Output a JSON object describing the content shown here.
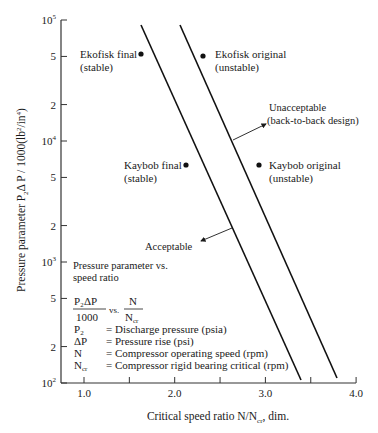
{
  "chart_data": {
    "type": "scatter",
    "title": "",
    "xlabel": "Critical speed ratio N/N_cr, dim.",
    "ylabel": "Pressure parameter P2ΔP / 1000(lb²/in⁴)",
    "xlim": [
      0.75,
      4.0
    ],
    "ylim": [
      100,
      100000
    ],
    "yscale": "log",
    "grid": false,
    "x_ticks": [
      {
        "v": 1.0,
        "label": "1.0"
      },
      {
        "v": 1.5,
        "label": ""
      },
      {
        "v": 2.0,
        "label": "2.0"
      },
      {
        "v": 2.5,
        "label": ""
      },
      {
        "v": 3.0,
        "label": "3.0"
      },
      {
        "v": 3.5,
        "label": ""
      },
      {
        "v": 4.0,
        "label": "4.0"
      }
    ],
    "y_ticks": [
      {
        "v": 100000,
        "base": "10",
        "exp": "5",
        "label": ""
      },
      {
        "v": 50000,
        "label": "5"
      },
      {
        "v": 20000,
        "label": "2"
      },
      {
        "v": 10000,
        "base": "10",
        "exp": "4",
        "label": ""
      },
      {
        "v": 5000,
        "label": "5"
      },
      {
        "v": 2000,
        "label": "2"
      },
      {
        "v": 1000,
        "base": "10",
        "exp": "3",
        "label": ""
      },
      {
        "v": 500,
        "label": "5"
      },
      {
        "v": 200,
        "label": "2"
      },
      {
        "v": 100,
        "base": "10",
        "exp": "2",
        "label": ""
      }
    ],
    "points": [
      {
        "name": "Ekofisk final",
        "status": "(stable)",
        "x": 1.63,
        "y": 50000
      },
      {
        "name": "Ekofisk original",
        "status": "(unstable)",
        "x": 2.3,
        "y": 48000
      },
      {
        "name": "Kaybob final",
        "status": "(stable)",
        "x": 2.12,
        "y": 6000
      },
      {
        "name": "Kaybob original",
        "status": "(unstable)",
        "x": 2.92,
        "y": 6000
      }
    ],
    "series": [
      {
        "name": "Acceptable boundary",
        "x": [
          1.62,
          3.38
        ],
        "y": [
          90000,
          100
        ]
      },
      {
        "name": "Unacceptable boundary (back-to-back design)",
        "x": [
          2.05,
          3.78
        ],
        "y": [
          90000,
          100
        ]
      }
    ],
    "annotations": {
      "unacceptable": [
        "Unacceptable",
        "(back-to-back design)"
      ],
      "acceptable": "Acceptable",
      "legend_title": [
        "Pressure parameter vs.",
        "speed ratio"
      ],
      "formula_num": "P₂ΔP",
      "formula_den": "1000",
      "formula_vs": "vs.",
      "formula_rnum": "N",
      "formula_rden_base": "N",
      "formula_rden_sub": "cr",
      "definitions": [
        {
          "sym": "P",
          "sub": "2",
          "desc": "= Discharge pressure (psia)"
        },
        {
          "sym": "ΔP",
          "sub": "",
          "desc": "= Pressure rise (psi)"
        },
        {
          "sym": "N",
          "sub": "",
          "desc": "= Compressor operating speed (rpm)"
        },
        {
          "sym": "N",
          "sub": "cr",
          "desc": "= Compressor rigid bearing critical (rpm)"
        }
      ]
    },
    "axis_labels": {
      "y_pre": "Pressure parameter P",
      "y_sub": "2",
      "y_post": "Δ P / 1000(lb",
      "y_sup1": "2",
      "y_mid": "/in",
      "y_sup2": "4",
      "y_end": ")",
      "x_pre": "Critical speed ratio N/N",
      "x_sub": "cr",
      "x_post": ", dim."
    }
  }
}
